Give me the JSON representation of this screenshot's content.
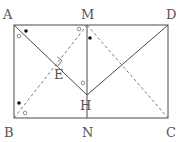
{
  "diagram": {
    "type": "geometry",
    "points": {
      "A": {
        "label": "A",
        "x": 14,
        "y": 25
      },
      "M": {
        "label": "M",
        "x": 87,
        "y": 25
      },
      "D": {
        "label": "D",
        "x": 168,
        "y": 25
      },
      "B": {
        "label": "B",
        "x": 14,
        "y": 118
      },
      "N": {
        "label": "N",
        "x": 87,
        "y": 118
      },
      "C": {
        "label": "C",
        "x": 168,
        "y": 118
      },
      "H": {
        "label": "H",
        "x": 87,
        "y": 95
      },
      "E": {
        "label": "E",
        "x": 53,
        "y": 62
      }
    },
    "segments": {
      "solid": [
        "AD",
        "DC",
        "CB",
        "BA",
        "MN",
        "AH",
        "HD"
      ],
      "dashed": [
        "BM",
        "MC"
      ]
    },
    "markers": {
      "right_angle_at": "E",
      "dots": [
        "angle at A (near AD)",
        "angle at M (near MN)",
        "angle at B (near BA)"
      ],
      "circles": [
        "angle at A (near AB)",
        "angle at M (near MB)",
        "angle at H (near HA)",
        "angle at B (near BM)"
      ]
    },
    "colors": {
      "line": "#4a4a4a",
      "dashed": "#6a6a6a",
      "label": "#555555",
      "background": "#ffffff"
    }
  }
}
